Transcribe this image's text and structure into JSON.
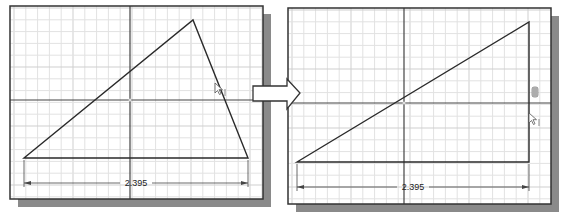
{
  "colors": {
    "background": "#ffffff",
    "panel_fill": "#ffffff",
    "panel_border": "#333333",
    "shadow": "#8a8a8a",
    "grid_minor": "#e2e2e2",
    "grid_major": "#cfcfcf",
    "axis": "#444444",
    "geometry": "#2a2a2a",
    "dimension": "#444444",
    "arrow_fill": "#ffffff",
    "arrow_stroke": "#333333"
  },
  "panels": [
    {
      "id": "before",
      "frame": {
        "x": 10,
        "y": 6,
        "w": 253,
        "h": 193
      },
      "shadow_offset": 8,
      "grid_spacing": 11.8,
      "grid_origin": {
        "x": 14,
        "y": 8
      },
      "axes": {
        "x": 130,
        "y": 100
      },
      "triangle": [
        [
          24,
          158
        ],
        [
          193,
          20
        ],
        [
          248,
          158
        ]
      ],
      "cursor": {
        "x": 215,
        "y": 83,
        "label": "I"
      },
      "dimension": {
        "x1": 24,
        "x2": 248,
        "y": 183,
        "ext_from_y": 158,
        "label": "2.395"
      }
    },
    {
      "id": "after",
      "frame": {
        "x": 288,
        "y": 8,
        "w": 263,
        "h": 196
      },
      "shadow_offset": 8,
      "grid_spacing": 11.8,
      "grid_origin": {
        "x": 292,
        "y": 10
      },
      "axes": {
        "x": 404,
        "y": 103
      },
      "triangle": [
        [
          297,
          162
        ],
        [
          529,
          22
        ],
        [
          529,
          162
        ]
      ],
      "cursor": {
        "x": 529,
        "y": 113,
        "label": "I"
      },
      "constraint_glyph": {
        "x": 535,
        "y": 92,
        "label": "vertical-constraint"
      },
      "dimension": {
        "x1": 297,
        "x2": 529,
        "y": 187,
        "ext_from_y": 162,
        "label": "2.395"
      }
    }
  ],
  "transition_arrow": {
    "body": {
      "x1": 253,
      "y1": 86,
      "x2": 287,
      "y2": 101
    },
    "head": {
      "base_x": 287,
      "top_y": 79,
      "bottom_y": 109,
      "tip_x": 300,
      "tip_y": 93
    }
  }
}
